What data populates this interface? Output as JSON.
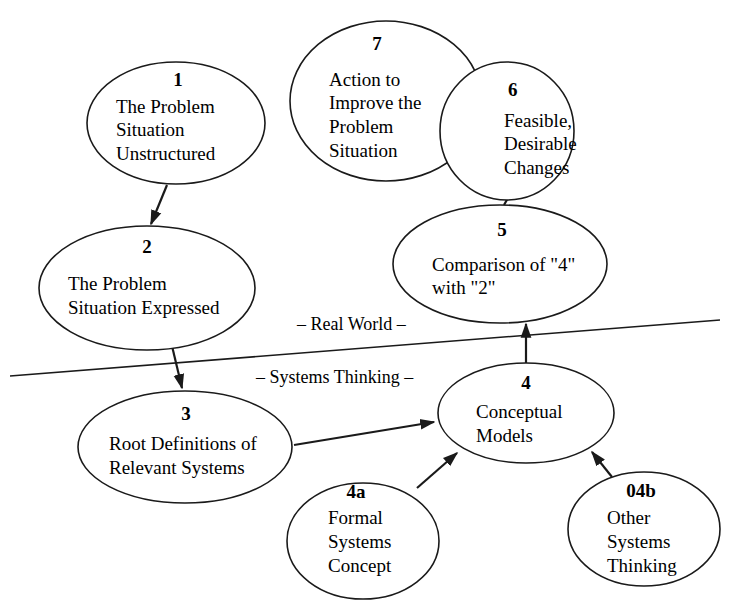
{
  "diagram": {
    "type": "flow",
    "regions": {
      "upper": "– Real World –",
      "lower": "– Systems Thinking –"
    },
    "nodes": [
      {
        "id": "1",
        "number": "1",
        "lines": [
          "The Problem",
          "Situation",
          "Unstructured"
        ]
      },
      {
        "id": "2",
        "number": "2",
        "lines": [
          "The Problem",
          "Situation Expressed"
        ]
      },
      {
        "id": "3",
        "number": "3",
        "lines": [
          "Root Definitions of",
          "Relevant Systems"
        ]
      },
      {
        "id": "4",
        "number": "4",
        "lines": [
          "Conceptual",
          "Models"
        ]
      },
      {
        "id": "4a",
        "number": "4a",
        "lines": [
          "Formal",
          "Systems",
          "Concept"
        ]
      },
      {
        "id": "04b",
        "number": "04b",
        "lines": [
          "Other",
          "Systems",
          "Thinking"
        ]
      },
      {
        "id": "5",
        "number": "5",
        "lines": [
          "Comparison of \"4\"",
          "with \"2\""
        ]
      },
      {
        "id": "6",
        "number": "6",
        "lines": [
          "Feasible,",
          "Desirable",
          "Changes"
        ]
      },
      {
        "id": "7",
        "number": "7",
        "lines": [
          "Action to",
          "Improve the",
          "Problem",
          "Situation"
        ]
      }
    ],
    "edges": [
      {
        "from": "1",
        "to": "2"
      },
      {
        "from": "2",
        "to": "3"
      },
      {
        "from": "3",
        "to": "4"
      },
      {
        "from": "4a",
        "to": "4"
      },
      {
        "from": "04b",
        "to": "4"
      },
      {
        "from": "4",
        "to": "5"
      },
      {
        "from": "5",
        "to": "6"
      },
      {
        "from": "6",
        "to": "7"
      }
    ]
  }
}
